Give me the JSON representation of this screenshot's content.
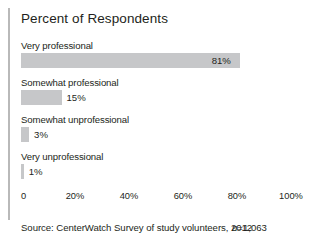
{
  "figure": {
    "title": "Percent of Respondents",
    "source_text": "Source: CenterWatch Survey of study volunteers, 2012",
    "sample_size_prefix": "n",
    "sample_size_value": "=1,063"
  },
  "chart_data": {
    "type": "bar",
    "orientation": "horizontal",
    "title": "Percent of Respondents",
    "xlabel": "",
    "ylabel": "",
    "xlim": [
      0,
      100
    ],
    "grid": false,
    "legend": "none",
    "bar_color": "#c6c7c9",
    "categories": [
      "Very professional",
      "Somewhat professional",
      "Somewhat unprofessional",
      "Very unprofessional"
    ],
    "values": [
      81,
      15,
      3,
      1
    ],
    "data_labels": [
      "81%",
      "15%",
      "3%",
      "1%"
    ],
    "tick_labels": [
      "0",
      "20%",
      "40%",
      "60%",
      "80%",
      "100%"
    ],
    "tick_values": [
      0,
      20,
      40,
      60,
      80,
      100
    ]
  }
}
